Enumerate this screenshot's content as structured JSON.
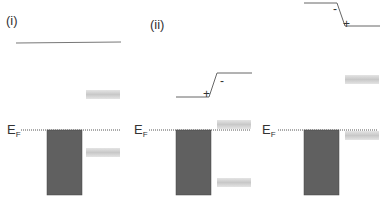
{
  "panels": [
    {
      "label": "(i)",
      "ef_main": "E",
      "ef_sub": "F"
    },
    {
      "label": "(ii)",
      "ef_main": "E",
      "ef_sub": "F",
      "charge_left": "+",
      "charge_right": "-"
    },
    {
      "label": "",
      "ef_main": "E",
      "ef_sub": "F",
      "charge_left": "-",
      "charge_right": "+"
    }
  ],
  "colors": {
    "metal_block": "#606060",
    "level_band": "#d0d0d0",
    "line": "#666666",
    "fermi_dotted": "#555555"
  }
}
